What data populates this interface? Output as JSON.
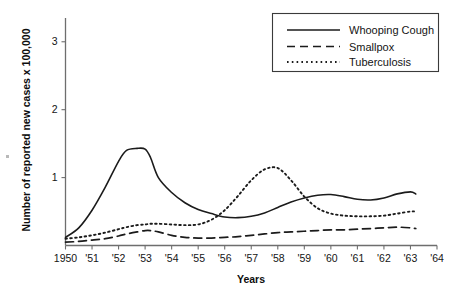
{
  "chart_data": {
    "type": "line",
    "title": "",
    "xlabel": "Years",
    "ylabel": "Number of reported new cases x 100,000",
    "xlim": [
      1950,
      1964
    ],
    "ylim": [
      0,
      3.35
    ],
    "grid": false,
    "legend_position": "top-right",
    "x_tick_labels": [
      "1950",
      "'51",
      "'52",
      "'53",
      "'54",
      "'55",
      "'56",
      "'57",
      "'58",
      "'59",
      "'60",
      "'61",
      "'62",
      "'63",
      "'64"
    ],
    "x_tick_values": [
      1950,
      1951,
      1952,
      1953,
      1954,
      1955,
      1956,
      1957,
      1958,
      1959,
      1960,
      1961,
      1962,
      1963,
      1964
    ],
    "y_tick_labels": [
      "1",
      "2",
      "3"
    ],
    "y_tick_values": [
      1,
      2,
      3
    ],
    "x": [
      1950,
      1950.5,
      1951,
      1951.5,
      1952,
      1952.3,
      1952.7,
      1953,
      1953.2,
      1953.5,
      1954,
      1954.5,
      1955,
      1955.5,
      1956,
      1956.5,
      1957,
      1957.5,
      1958,
      1958.5,
      1959,
      1959.5,
      1960,
      1960.5,
      1961,
      1961.5,
      1962,
      1962.5,
      1963,
      1963.2
    ],
    "series": [
      {
        "name": "Whooping Cough",
        "style": "solid",
        "values": [
          0.12,
          0.26,
          0.52,
          0.86,
          1.24,
          1.4,
          1.43,
          1.42,
          1.3,
          1.0,
          0.78,
          0.63,
          0.53,
          0.47,
          0.42,
          0.41,
          0.43,
          0.48,
          0.56,
          0.64,
          0.7,
          0.74,
          0.75,
          0.72,
          0.68,
          0.67,
          0.7,
          0.76,
          0.79,
          0.76
        ]
      },
      {
        "name": "Smallpox",
        "style": "dashed",
        "values": [
          0.05,
          0.06,
          0.08,
          0.1,
          0.14,
          0.17,
          0.2,
          0.22,
          0.22,
          0.2,
          0.15,
          0.12,
          0.11,
          0.11,
          0.12,
          0.13,
          0.15,
          0.17,
          0.19,
          0.2,
          0.21,
          0.22,
          0.23,
          0.23,
          0.24,
          0.25,
          0.26,
          0.27,
          0.26,
          0.25
        ]
      },
      {
        "name": "Tuberculosis",
        "style": "dotted",
        "values": [
          0.1,
          0.12,
          0.15,
          0.19,
          0.24,
          0.27,
          0.3,
          0.31,
          0.32,
          0.32,
          0.31,
          0.3,
          0.31,
          0.38,
          0.52,
          0.73,
          0.96,
          1.12,
          1.14,
          0.96,
          0.72,
          0.55,
          0.47,
          0.44,
          0.43,
          0.43,
          0.44,
          0.47,
          0.5,
          0.5
        ]
      }
    ],
    "legend": [
      {
        "label": "Whooping Cough",
        "style": "solid"
      },
      {
        "label": "Smallpox",
        "style": "dashed"
      },
      {
        "label": "Tuberculosis",
        "style": "dotted"
      }
    ]
  }
}
